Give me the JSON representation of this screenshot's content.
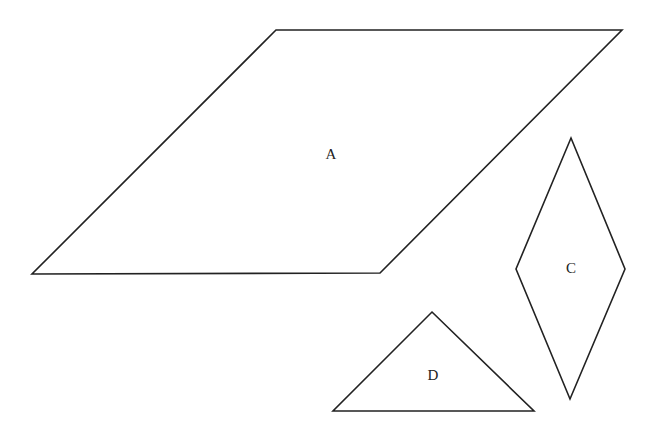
{
  "diagram": {
    "title": "",
    "stroke_color": "#222222",
    "background": "#ffffff",
    "shapes": [
      {
        "id": "A",
        "type": "parallelogram",
        "label": "A",
        "points": "276,30 622,30 380,273 32,274",
        "label_pos": {
          "x": 331,
          "y": 159
        }
      },
      {
        "id": "C",
        "type": "rhombus",
        "label": "C",
        "points": "571,138 625,269 570,399 516,269",
        "label_pos": {
          "x": 571,
          "y": 273
        }
      },
      {
        "id": "D",
        "type": "triangle",
        "label": "D",
        "points": "432,312 534,411 333,411",
        "label_pos": {
          "x": 433,
          "y": 380
        }
      }
    ]
  }
}
